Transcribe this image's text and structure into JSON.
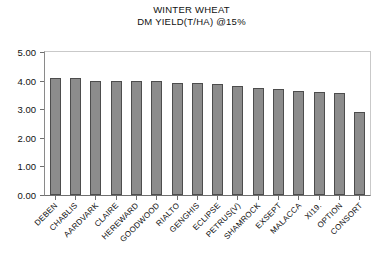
{
  "chart_data": {
    "type": "bar",
    "title": "WINTER WHEAT",
    "subtitle": "DM YIELD(T/HA) @15%",
    "xlabel": "",
    "ylabel": "",
    "ylim": [
      0.0,
      5.0
    ],
    "ytick_labels": [
      "5.00",
      "4.00",
      "3.00",
      "2.00",
      "1.00",
      "0.00"
    ],
    "ytick_values": [
      5.0,
      4.0,
      3.0,
      2.0,
      1.0,
      0.0
    ],
    "grid": false,
    "legend": "none",
    "bar_color": "#8c8c8c",
    "bar_edge_color": "#4d4d4d",
    "categories": [
      "DEBEN",
      "CHABLIS",
      "AARDVARK",
      "CLAIRE",
      "HEREWARD",
      "GOODWOOD",
      "RIALTO",
      "GENGHIS",
      "ECLIPSE",
      "PETRUS(V)",
      "SHAMROCK",
      "EXSEPT",
      "MALACCA",
      "XI19.",
      "OPTION",
      "CONSORT"
    ],
    "values": [
      4.1,
      4.1,
      4.0,
      4.0,
      4.0,
      3.98,
      3.9,
      3.9,
      3.88,
      3.82,
      3.75,
      3.7,
      3.62,
      3.6,
      3.58,
      2.9
    ]
  }
}
